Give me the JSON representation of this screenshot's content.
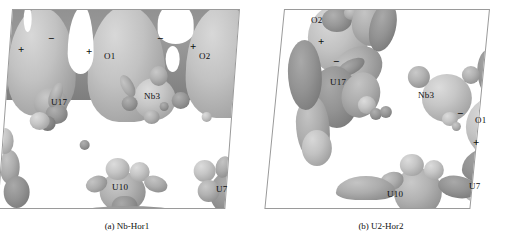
{
  "figure": {
    "type": "isosurface-visualization",
    "panel_count": 2,
    "rendering": "grayscale charge-density isosurface",
    "background_color": "#ffffff",
    "frame_color": "#9a9a9a"
  },
  "panels": [
    {
      "id": "a",
      "caption": "(a) Nb-Hor1",
      "atom_labels": [
        {
          "text": "O1",
          "x": 110,
          "y": 57
        },
        {
          "text": "O2",
          "x": 205,
          "y": 57
        },
        {
          "text": "U17",
          "x": 50,
          "y": 102
        },
        {
          "text": "Nb3",
          "x": 152,
          "y": 97
        },
        {
          "text": "U10",
          "x": 120,
          "y": 187
        },
        {
          "text": "U7",
          "x": 222,
          "y": 189
        }
      ],
      "sign_labels": [
        {
          "text": "+",
          "x": 18,
          "y": 44
        },
        {
          "text": "−",
          "x": 48,
          "y": 33
        },
        {
          "text": "+",
          "x": 86,
          "y": 46
        },
        {
          "text": "−",
          "x": 157,
          "y": 33
        },
        {
          "text": "+",
          "x": 190,
          "y": 41
        }
      ]
    },
    {
      "id": "b",
      "caption": "(b) U2-Hor2",
      "atom_labels": [
        {
          "text": "O2",
          "x": 62,
          "y": 20
        },
        {
          "text": "U17",
          "x": 83,
          "y": 82
        },
        {
          "text": "Nb3",
          "x": 172,
          "y": 95
        },
        {
          "text": "O1",
          "x": 226,
          "y": 120
        },
        {
          "text": "U10",
          "x": 141,
          "y": 194
        },
        {
          "text": "U7",
          "x": 221,
          "y": 186
        }
      ],
      "sign_labels": [
        {
          "text": "+",
          "x": 64,
          "y": 41
        },
        {
          "text": "−",
          "x": 79,
          "y": 61
        },
        {
          "text": "−",
          "x": 203,
          "y": 113
        },
        {
          "text": "+",
          "x": 219,
          "y": 142
        }
      ]
    }
  ]
}
